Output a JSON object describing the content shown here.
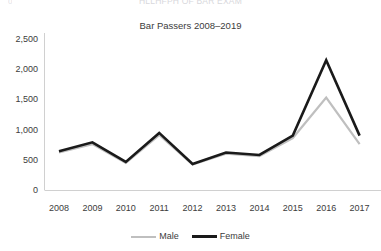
{
  "header": {
    "super_title": "HLLHFPH OF BAR EXAM",
    "corner_mark": "0"
  },
  "chart_data": {
    "type": "line",
    "title": "Bar Passers 2008–2019",
    "xlabel": "",
    "ylabel": "",
    "grid": false,
    "legend_position": "bottom",
    "categories": [
      "2008",
      "2009",
      "2010",
      "2011",
      "2012",
      "2013",
      "2014",
      "2015",
      "2016",
      "2017"
    ],
    "ylim": [
      0,
      2500
    ],
    "yticks": [
      0,
      500,
      1000,
      1500,
      2000,
      2500
    ],
    "ytick_labels": [
      "0",
      "500",
      "1,000",
      "1,500",
      "2,000",
      "2,500"
    ],
    "series": [
      {
        "name": "Male",
        "color": "#bfbfbf",
        "values": [
          620,
          760,
          450,
          910,
          420,
          600,
          560,
          860,
          1530,
          760
        ]
      },
      {
        "name": "Female",
        "color": "#1a1a1a",
        "values": [
          640,
          790,
          465,
          945,
          430,
          620,
          580,
          900,
          2150,
          900
        ]
      }
    ]
  }
}
